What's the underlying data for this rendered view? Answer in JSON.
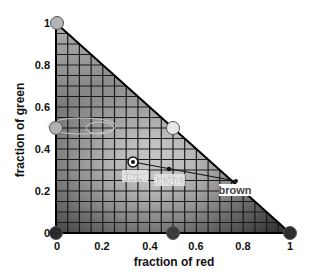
{
  "chart_data": {
    "type": "scatter",
    "title": "",
    "xlabel": "fraction of red",
    "ylabel": "fraction of green",
    "xlim": [
      0,
      1
    ],
    "ylim": [
      0,
      1
    ],
    "x_ticks": [
      "0",
      "0.2",
      "0.4",
      "0.6",
      "0.8",
      "1"
    ],
    "y_ticks": [
      "0",
      "0.2",
      "0.4",
      "0.6",
      "0.8",
      "1"
    ],
    "grid": true,
    "grid_step": 0.05,
    "region": "triangle r + g <= 1 (chromaticity simplex)",
    "vertices": [
      {
        "name": "green",
        "r": 0,
        "g": 1,
        "fill": "#b4b4b4"
      },
      {
        "name": "black-origin",
        "r": 0,
        "g": 0,
        "fill": "#2a2a2a"
      },
      {
        "name": "red",
        "r": 1,
        "g": 0,
        "fill": "#2e2e2e"
      }
    ],
    "midpoints": [
      {
        "r": 0,
        "g": 0.5,
        "fill": "#b0b0b0"
      },
      {
        "r": 0.5,
        "g": 0.5,
        "fill": "#e6e6e6"
      },
      {
        "r": 0.5,
        "g": 0,
        "fill": "#3a3a3a"
      }
    ],
    "points": [
      {
        "label": "gray",
        "r": 0.33,
        "g": 0.34
      },
      {
        "label": "beige",
        "r": 0.48,
        "g": 0.3
      },
      {
        "label": "brown",
        "r": 0.77,
        "g": 0.24
      }
    ],
    "line": {
      "from": "gray",
      "to": "brown"
    },
    "annotations": [
      "gray",
      "beige",
      "brown"
    ]
  },
  "labels": {
    "xlabel": "fraction of red",
    "ylabel": "fraction of green",
    "gray": "gray",
    "beige": "beige",
    "brown": "brown"
  },
  "ticks": {
    "x": [
      "0",
      "0.2",
      "0.4",
      "0.6",
      "0.8",
      "1"
    ],
    "y": [
      "0",
      "0.2",
      "0.4",
      "0.6",
      "0.8",
      "1"
    ]
  }
}
